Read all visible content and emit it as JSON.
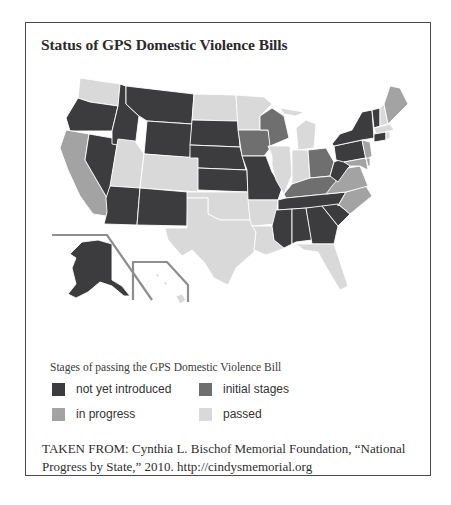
{
  "title": "Status of GPS Domestic Violence Bills",
  "legend": {
    "title": "Stages of passing the GPS Domestic Violence Bill",
    "items": [
      {
        "key": "not_yet",
        "label": "not yet introduced",
        "color": "#3c3c3e"
      },
      {
        "key": "initial",
        "label": "initial stages",
        "color": "#6f6f70"
      },
      {
        "key": "in_progress",
        "label": "in progress",
        "color": "#a3a3a4"
      },
      {
        "key": "passed",
        "label": "passed",
        "color": "#d9d9d9"
      }
    ]
  },
  "source": "TAKEN FROM: Cynthia L. Bischof Memorial Foundation, “National Progress by State,” 2010. http://cindysmemorial.org",
  "states": {
    "not_yet": [
      "OR",
      "ID",
      "MT",
      "WY",
      "NV",
      "AZ",
      "NM",
      "SD",
      "NE",
      "KS",
      "MO",
      "TN",
      "MS",
      "AL",
      "GA",
      "SC",
      "WV",
      "PA",
      "NY",
      "VT",
      "CT",
      "AK"
    ],
    "initial": [
      "WI",
      "IA",
      "OH",
      "KY"
    ],
    "in_progress": [
      "CA",
      "ME",
      "VA",
      "NC",
      "NJ",
      "DE",
      "MD"
    ],
    "passed": [
      "WA",
      "UT",
      "CO",
      "ND",
      "MN",
      "MI",
      "IL",
      "IN",
      "TX",
      "OK",
      "AR",
      "LA",
      "FL",
      "NH",
      "MA",
      "RI",
      "HI"
    ]
  }
}
